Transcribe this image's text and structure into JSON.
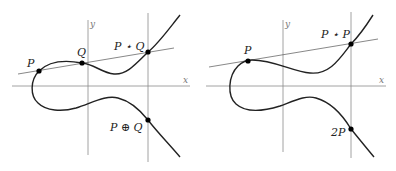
{
  "figure": {
    "left": {
      "title": "Point addition",
      "axis_x_label": "x",
      "axis_y_label": "y",
      "points": [
        {
          "id": "P",
          "label": "P"
        },
        {
          "id": "Q",
          "label": "Q"
        },
        {
          "id": "PstarQ",
          "label": "P ⋆ Q"
        },
        {
          "id": "PplusQ",
          "label": "P ⊕ Q"
        }
      ]
    },
    "right": {
      "title": "Point doubling",
      "axis_x_label": "x",
      "axis_y_label": "y",
      "points": [
        {
          "id": "P",
          "label": "P"
        },
        {
          "id": "PstarP",
          "label": "P ⋆ P"
        },
        {
          "id": "twoP",
          "label": "2P"
        }
      ]
    },
    "colors": {
      "curve": "#222222",
      "axis": "#8a8a8a",
      "line": "#555555",
      "point": "#000000"
    }
  }
}
